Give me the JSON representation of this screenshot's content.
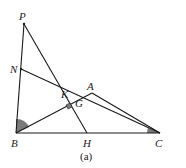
{
  "figure": {
    "caption": "(a)",
    "points": {
      "P": {
        "label": "P",
        "x": 24,
        "y": 24
      },
      "N": {
        "label": "N",
        "x": 21,
        "y": 69
      },
      "B": {
        "label": "B",
        "x": 16,
        "y": 133
      },
      "C": {
        "label": "C",
        "x": 160,
        "y": 133
      },
      "H": {
        "label": "H",
        "x": 87,
        "y": 133
      },
      "A": {
        "label": "A",
        "x": 92,
        "y": 93
      },
      "K": {
        "label": "K",
        "x": 69,
        "y": 92
      },
      "G": {
        "label": "G",
        "x": 75,
        "y": 101
      }
    },
    "segments": [
      [
        "P",
        "B"
      ],
      [
        "P",
        "H"
      ],
      [
        "N",
        "C"
      ],
      [
        "B",
        "A"
      ],
      [
        "A",
        "C"
      ],
      [
        "B",
        "C"
      ]
    ],
    "angle_marks": [
      "angle-B",
      "angle-C"
    ],
    "right_angle_at": "G",
    "colors": {
      "line": "#1a1a1a",
      "angle_fill": "#7a7a7a"
    }
  }
}
